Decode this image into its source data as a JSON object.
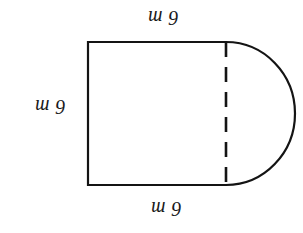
{
  "figure": {
    "orientation_note": "scan is rotated 180 degrees",
    "stroke_color": "#141414",
    "background_color": "#ffffff",
    "labels": {
      "top": "6 m",
      "left": "6 m",
      "bottom": "6 m"
    },
    "shape": {
      "rectangle": {
        "left": 88,
        "top": 42,
        "right": 226,
        "bottom": 185,
        "width": 138,
        "height": 143
      },
      "semicircle": {
        "center_x": 226,
        "center_y": 113.5,
        "radius_x": 69,
        "radius_y": 71.5,
        "side": "right"
      },
      "dashed_divider": {
        "x": 226,
        "top": 42,
        "bottom": 185,
        "dash_count": 6
      }
    }
  }
}
